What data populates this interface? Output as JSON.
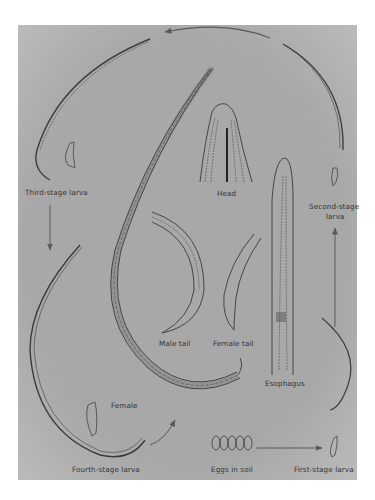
{
  "figure": {
    "background_color": "#a8a8a8",
    "line_color": "#3a3a3a",
    "labels": {
      "head": "Head",
      "third_stage_larva": "Third-stage larva",
      "second_stage_larva_line1": "Second-stage",
      "second_stage_larva_line2": "larva",
      "male_tail": "Male tail",
      "female_tail": "Female tail",
      "esophagus": "Esophagus",
      "female": "Female",
      "fourth_stage_larva": "Fourth-stage larva",
      "eggs_in_soil": "Eggs in soil",
      "first_stage_larva": "First-stage larva"
    },
    "cycle_order": [
      "Eggs in soil",
      "First-stage larva",
      "Second-stage larva",
      "Third-stage larva",
      "Fourth-stage larva",
      "Female"
    ]
  }
}
